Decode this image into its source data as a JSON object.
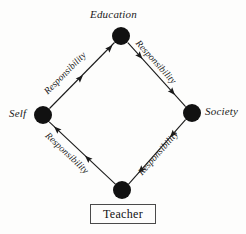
{
  "diagram": {
    "type": "node-link-diagram",
    "title_visible": false,
    "background_color": "#fdfdfc",
    "stroke_color": "#1a1a1a",
    "node_fill_color": "#111111",
    "nodes": [
      {
        "id": "education",
        "label": "Education",
        "shape": "filled-circle",
        "cx": 121,
        "cy": 36,
        "r": 9,
        "label_position": "above"
      },
      {
        "id": "self",
        "label": "Self",
        "shape": "filled-circle",
        "cx": 43,
        "cy": 115,
        "r": 9,
        "label_position": "left"
      },
      {
        "id": "society",
        "label": "Society",
        "shape": "filled-circle",
        "cx": 192,
        "cy": 113,
        "r": 9,
        "label_position": "right"
      },
      {
        "id": "teacher-node",
        "label": "",
        "shape": "filled-circle",
        "cx": 122,
        "cy": 190,
        "r": 9,
        "label_position": "none"
      }
    ],
    "box": {
      "id": "teacher-box",
      "label": "Teacher",
      "x": 90,
      "y": 204,
      "width": 66,
      "height": 20
    },
    "edges": [
      {
        "id": "self-to-education",
        "from": "self",
        "to": "education",
        "label": "Responsibility",
        "direction": "to-education",
        "arrowheads": 2
      },
      {
        "id": "education-to-society",
        "from": "education",
        "to": "society",
        "label": "Responsibility",
        "direction": "to-society",
        "arrowheads": 2
      },
      {
        "id": "teacher-to-self",
        "from": "teacher-node",
        "to": "self",
        "label": "Responsibility",
        "direction": "to-self",
        "arrowheads": 2
      },
      {
        "id": "society-to-teacher",
        "from": "society",
        "to": "teacher-node",
        "label": "Responsibility",
        "direction": "to-teacher",
        "arrowheads": 2
      }
    ],
    "edge_label_text": "Responsibility"
  }
}
